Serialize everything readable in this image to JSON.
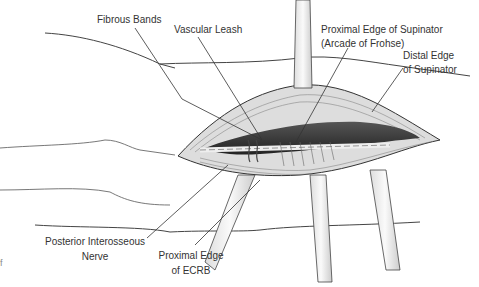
{
  "figure": {
    "labels": {
      "fibrous_bands": "Fibrous Bands",
      "vascular_leash": "Vascular Leash",
      "proximal_supinator_1": "Proximal Edge of Supinator",
      "proximal_supinator_2": "(Arcade of Frohse)",
      "distal_supinator_1": "Distal Edge",
      "distal_supinator_2": "of Supinator",
      "pin_1": "Posterior Interosseous",
      "pin_2": "Nerve",
      "ecrb_1": "Proximal Edge",
      "ecrb_2": "of ECRB",
      "edge_fragment": "f"
    }
  }
}
